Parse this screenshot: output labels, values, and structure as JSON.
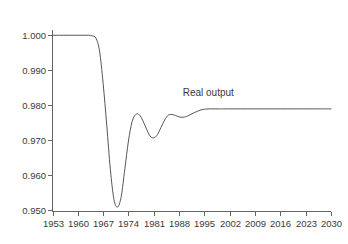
{
  "chart_data": {
    "type": "line",
    "title": "",
    "subtitle": "",
    "xlabel": "",
    "ylabel": "",
    "grid": false,
    "legend_position": "inline-annotation",
    "annotations": [
      {
        "text": "Real output",
        "x": 1989,
        "y": 0.9825
      }
    ],
    "xlim": [
      1953,
      2030
    ],
    "ylim": [
      0.9495,
      1.0015
    ],
    "xticks": [
      1953,
      1960,
      1967,
      1974,
      1981,
      1988,
      1995,
      2002,
      2009,
      2016,
      2023,
      2030
    ],
    "xtick_labels": [
      "1953",
      "1960",
      "1967",
      "1974",
      "1981",
      "1988",
      "1995",
      "2002",
      "2009",
      "2016",
      "2023",
      "2030"
    ],
    "yticks": [
      0.95,
      0.96,
      0.97,
      0.98,
      0.99,
      1.0
    ],
    "ytick_labels": [
      "0.950",
      "0.960",
      "0.970",
      "0.980",
      "0.990",
      "1.000"
    ],
    "series": [
      {
        "name": "Real output",
        "color": "#555555",
        "x": [
          1953,
          1954,
          1955,
          1956,
          1957,
          1958,
          1959,
          1960,
          1961,
          1962,
          1963,
          1964,
          1965,
          1966,
          1967,
          1968,
          1969,
          1970,
          1971,
          1972,
          1973,
          1974,
          1975,
          1976,
          1977,
          1978,
          1979,
          1980,
          1981,
          1982,
          1983,
          1984,
          1985,
          1986,
          1987,
          1988,
          1989,
          1990,
          1991,
          1992,
          1993,
          1994,
          1995,
          1996,
          1997,
          1998,
          1999,
          2000,
          2002,
          2005,
          2009,
          2012,
          2016,
          2020,
          2023,
          2026,
          2030
        ],
        "y": [
          1.0,
          1.0,
          1.0,
          1.0,
          1.0,
          1.0,
          1.0,
          1.0,
          1.0,
          1.0,
          1.0,
          0.9998,
          0.9992,
          0.9955,
          0.9862,
          0.9742,
          0.9615,
          0.9529,
          0.9508,
          0.9538,
          0.9617,
          0.9697,
          0.9752,
          0.9773,
          0.9772,
          0.9755,
          0.9731,
          0.9711,
          0.9706,
          0.9715,
          0.9736,
          0.9757,
          0.9771,
          0.9773,
          0.977,
          0.9766,
          0.9765,
          0.9767,
          0.9772,
          0.9777,
          0.9782,
          0.9786,
          0.9788,
          0.9789,
          0.9789,
          0.9789,
          0.9789,
          0.9789,
          0.9789,
          0.9789,
          0.9789,
          0.9789,
          0.9789,
          0.9789,
          0.9789,
          0.9789,
          0.9789
        ]
      }
    ]
  },
  "accessibility": {
    "figure_name": "real-output-impulse-response-chart"
  }
}
